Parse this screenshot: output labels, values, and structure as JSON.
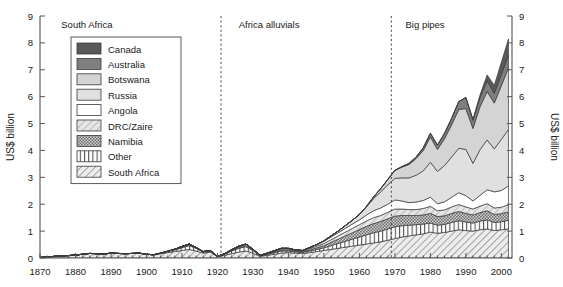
{
  "chart_data": {
    "type": "area",
    "title": "",
    "subtitle": "",
    "xlabel": "",
    "ylabel": "US$ billion",
    "ylabel_right": "US$ billion",
    "xlim": [
      1870,
      2003
    ],
    "ylim": [
      0,
      9
    ],
    "grid": false,
    "stacked": true,
    "legend_position": "upper-left-inside",
    "xticks": [
      1870,
      1880,
      1890,
      1900,
      1910,
      1920,
      1930,
      1940,
      1950,
      1960,
      1970,
      1980,
      1990,
      2000
    ],
    "xtick_labels": [
      "1870",
      "1880",
      "1890",
      "1900",
      "1910",
      "1920",
      "1930",
      "1940",
      "1950",
      "1960",
      "1970",
      "1980",
      "1990",
      "2000"
    ],
    "yticks": [
      0,
      1,
      2,
      3,
      4,
      5,
      6,
      7,
      8,
      9
    ],
    "ytick_labels": [
      "0",
      "1",
      "2",
      "3",
      "4",
      "5",
      "6",
      "7",
      "8",
      "9"
    ],
    "annotations": [
      {
        "name": "era-south-africa",
        "label": "South Africa",
        "x": 1876,
        "y": 8.55
      },
      {
        "name": "era-africa-alluvials",
        "label": "Africa alluvials",
        "x": 1926,
        "y": 8.55
      },
      {
        "name": "era-big-pipes",
        "label": "Big pipes",
        "x": 1973,
        "y": 8.55
      }
    ],
    "dividers": [
      {
        "name": "divider-1921",
        "x": 1921
      },
      {
        "name": "divider-1969",
        "x": 1969
      }
    ],
    "x": [
      1870,
      1872,
      1874,
      1876,
      1878,
      1880,
      1882,
      1884,
      1886,
      1888,
      1890,
      1892,
      1894,
      1896,
      1898,
      1900,
      1902,
      1904,
      1906,
      1908,
      1910,
      1912,
      1914,
      1916,
      1918,
      1920,
      1922,
      1924,
      1926,
      1928,
      1930,
      1932,
      1934,
      1936,
      1938,
      1940,
      1942,
      1944,
      1946,
      1948,
      1950,
      1952,
      1954,
      1956,
      1958,
      1960,
      1962,
      1964,
      1966,
      1968,
      1970,
      1972,
      1974,
      1976,
      1978,
      1980,
      1982,
      1984,
      1986,
      1988,
      1990,
      1992,
      1994,
      1996,
      1998,
      2000,
      2002
    ],
    "series": [
      {
        "name": "South Africa",
        "pattern": "diagonal-hatch-down",
        "color": "#e8e8e8",
        "values": [
          0.02,
          0.04,
          0.06,
          0.08,
          0.09,
          0.11,
          0.14,
          0.17,
          0.16,
          0.15,
          0.18,
          0.17,
          0.16,
          0.17,
          0.18,
          0.14,
          0.12,
          0.16,
          0.2,
          0.24,
          0.28,
          0.32,
          0.26,
          0.18,
          0.22,
          0.05,
          0.1,
          0.16,
          0.22,
          0.26,
          0.18,
          0.06,
          0.1,
          0.14,
          0.18,
          0.2,
          0.18,
          0.16,
          0.2,
          0.24,
          0.28,
          0.32,
          0.36,
          0.4,
          0.44,
          0.48,
          0.52,
          0.56,
          0.6,
          0.66,
          0.72,
          0.78,
          0.82,
          0.86,
          0.9,
          0.96,
          0.92,
          0.95,
          1.0,
          1.05,
          1.02,
          1.0,
          1.05,
          1.08,
          1.02,
          1.05,
          1.08
        ]
      },
      {
        "name": "Other",
        "pattern": "vertical-stripes",
        "color": "#f2f2f2",
        "values": [
          0.0,
          0.0,
          0.0,
          0.0,
          0.0,
          0.0,
          0.0,
          0.0,
          0.0,
          0.0,
          0.0,
          0.0,
          0.0,
          0.0,
          0.0,
          0.0,
          0.0,
          0.02,
          0.04,
          0.06,
          0.1,
          0.14,
          0.1,
          0.04,
          0.04,
          0.01,
          0.04,
          0.1,
          0.14,
          0.16,
          0.1,
          0.02,
          0.04,
          0.06,
          0.08,
          0.06,
          0.05,
          0.05,
          0.06,
          0.08,
          0.1,
          0.14,
          0.18,
          0.22,
          0.26,
          0.3,
          0.34,
          0.38,
          0.4,
          0.42,
          0.44,
          0.42,
          0.4,
          0.38,
          0.36,
          0.34,
          0.3,
          0.3,
          0.32,
          0.34,
          0.32,
          0.3,
          0.32,
          0.34,
          0.3,
          0.3,
          0.32
        ]
      },
      {
        "name": "Namibia",
        "pattern": "dense-checker",
        "color": "#b8b8b8",
        "values": [
          0.0,
          0.0,
          0.0,
          0.0,
          0.0,
          0.0,
          0.0,
          0.0,
          0.0,
          0.0,
          0.0,
          0.0,
          0.0,
          0.0,
          0.0,
          0.0,
          0.0,
          0.0,
          0.01,
          0.02,
          0.03,
          0.04,
          0.02,
          0.01,
          0.01,
          0.0,
          0.01,
          0.02,
          0.03,
          0.04,
          0.02,
          0.01,
          0.01,
          0.02,
          0.03,
          0.03,
          0.02,
          0.02,
          0.04,
          0.06,
          0.08,
          0.12,
          0.16,
          0.2,
          0.24,
          0.28,
          0.32,
          0.34,
          0.36,
          0.38,
          0.4,
          0.38,
          0.36,
          0.34,
          0.34,
          0.36,
          0.32,
          0.32,
          0.34,
          0.34,
          0.32,
          0.3,
          0.32,
          0.34,
          0.3,
          0.3,
          0.32
        ]
      },
      {
        "name": "DRC/Zaire",
        "pattern": "light-diagonal-hatch",
        "color": "#dcdcdc",
        "values": [
          0.0,
          0.0,
          0.0,
          0.0,
          0.0,
          0.0,
          0.0,
          0.0,
          0.0,
          0.0,
          0.0,
          0.0,
          0.0,
          0.0,
          0.0,
          0.0,
          0.0,
          0.0,
          0.0,
          0.01,
          0.02,
          0.02,
          0.01,
          0.01,
          0.01,
          0.0,
          0.01,
          0.02,
          0.03,
          0.04,
          0.02,
          0.01,
          0.02,
          0.03,
          0.04,
          0.04,
          0.03,
          0.03,
          0.05,
          0.06,
          0.08,
          0.1,
          0.12,
          0.14,
          0.16,
          0.18,
          0.2,
          0.22,
          0.22,
          0.24,
          0.26,
          0.24,
          0.22,
          0.22,
          0.24,
          0.26,
          0.22,
          0.22,
          0.24,
          0.26,
          0.24,
          0.22,
          0.24,
          0.26,
          0.24,
          0.24,
          0.26
        ]
      },
      {
        "name": "Angola",
        "pattern": "solid",
        "color": "#ffffff",
        "values": [
          0.0,
          0.0,
          0.0,
          0.0,
          0.0,
          0.0,
          0.0,
          0.0,
          0.0,
          0.0,
          0.0,
          0.0,
          0.0,
          0.0,
          0.0,
          0.0,
          0.0,
          0.0,
          0.0,
          0.0,
          0.0,
          0.0,
          0.0,
          0.0,
          0.0,
          0.0,
          0.0,
          0.01,
          0.02,
          0.02,
          0.01,
          0.0,
          0.01,
          0.02,
          0.03,
          0.03,
          0.02,
          0.02,
          0.04,
          0.06,
          0.08,
          0.1,
          0.12,
          0.14,
          0.16,
          0.18,
          0.22,
          0.26,
          0.28,
          0.3,
          0.34,
          0.3,
          0.26,
          0.28,
          0.3,
          0.34,
          0.26,
          0.3,
          0.36,
          0.44,
          0.42,
          0.3,
          0.4,
          0.52,
          0.6,
          0.62,
          0.7
        ]
      },
      {
        "name": "Russia",
        "pattern": "solid",
        "color": "#e0e0e0",
        "values": [
          0.0,
          0.0,
          0.0,
          0.0,
          0.0,
          0.0,
          0.0,
          0.0,
          0.0,
          0.0,
          0.0,
          0.0,
          0.0,
          0.0,
          0.0,
          0.0,
          0.0,
          0.0,
          0.0,
          0.0,
          0.0,
          0.0,
          0.0,
          0.0,
          0.0,
          0.0,
          0.0,
          0.0,
          0.0,
          0.0,
          0.0,
          0.0,
          0.0,
          0.0,
          0.0,
          0.0,
          0.0,
          0.0,
          0.0,
          0.0,
          0.02,
          0.04,
          0.06,
          0.1,
          0.14,
          0.2,
          0.3,
          0.45,
          0.6,
          0.72,
          0.8,
          0.86,
          0.92,
          1.0,
          1.1,
          1.3,
          1.2,
          1.35,
          1.5,
          1.65,
          1.72,
          1.4,
          1.7,
          1.85,
          1.6,
          1.9,
          2.1
        ]
      },
      {
        "name": "Botswana",
        "pattern": "solid",
        "color": "#d4d4d4",
        "values": [
          0.0,
          0.0,
          0.0,
          0.0,
          0.0,
          0.0,
          0.0,
          0.0,
          0.0,
          0.0,
          0.0,
          0.0,
          0.0,
          0.0,
          0.0,
          0.0,
          0.0,
          0.0,
          0.0,
          0.0,
          0.0,
          0.0,
          0.0,
          0.0,
          0.0,
          0.0,
          0.0,
          0.0,
          0.0,
          0.0,
          0.0,
          0.0,
          0.0,
          0.0,
          0.0,
          0.0,
          0.0,
          0.0,
          0.0,
          0.0,
          0.0,
          0.0,
          0.0,
          0.0,
          0.0,
          0.0,
          0.02,
          0.06,
          0.12,
          0.2,
          0.3,
          0.4,
          0.5,
          0.62,
          0.76,
          0.94,
          0.82,
          1.0,
          1.2,
          1.44,
          1.52,
          1.3,
          1.6,
          1.8,
          1.7,
          2.0,
          2.3
        ]
      },
      {
        "name": "Australia",
        "pattern": "solid",
        "color": "#7f7f7f",
        "values": [
          0.0,
          0.0,
          0.0,
          0.0,
          0.0,
          0.0,
          0.0,
          0.0,
          0.0,
          0.0,
          0.0,
          0.0,
          0.0,
          0.0,
          0.0,
          0.0,
          0.0,
          0.0,
          0.0,
          0.0,
          0.0,
          0.0,
          0.0,
          0.0,
          0.0,
          0.0,
          0.0,
          0.0,
          0.0,
          0.0,
          0.0,
          0.0,
          0.0,
          0.0,
          0.0,
          0.0,
          0.0,
          0.0,
          0.0,
          0.0,
          0.0,
          0.0,
          0.0,
          0.0,
          0.0,
          0.0,
          0.0,
          0.0,
          0.0,
          0.0,
          0.0,
          0.02,
          0.04,
          0.06,
          0.1,
          0.14,
          0.16,
          0.2,
          0.24,
          0.3,
          0.4,
          0.3,
          0.34,
          0.4,
          0.36,
          0.42,
          0.46
        ]
      },
      {
        "name": "Canada",
        "pattern": "solid",
        "color": "#595959",
        "values": [
          0.0,
          0.0,
          0.0,
          0.0,
          0.0,
          0.0,
          0.0,
          0.0,
          0.0,
          0.0,
          0.0,
          0.0,
          0.0,
          0.0,
          0.0,
          0.0,
          0.0,
          0.0,
          0.0,
          0.0,
          0.0,
          0.0,
          0.0,
          0.0,
          0.0,
          0.0,
          0.0,
          0.0,
          0.0,
          0.0,
          0.0,
          0.0,
          0.0,
          0.0,
          0.0,
          0.0,
          0.0,
          0.0,
          0.0,
          0.0,
          0.0,
          0.0,
          0.0,
          0.0,
          0.0,
          0.0,
          0.0,
          0.0,
          0.0,
          0.0,
          0.0,
          0.0,
          0.0,
          0.0,
          0.0,
          0.0,
          0.0,
          0.0,
          0.0,
          0.0,
          0.02,
          0.04,
          0.1,
          0.22,
          0.3,
          0.45,
          0.6
        ]
      }
    ],
    "legend_order": [
      "Canada",
      "Australia",
      "Botswana",
      "Russia",
      "Angola",
      "DRC/Zaire",
      "Namibia",
      "Other",
      "South Africa"
    ]
  }
}
